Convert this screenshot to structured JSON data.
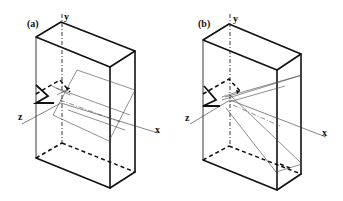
{
  "figure": {
    "panels": [
      {
        "id": "a",
        "label": "(a)",
        "axes": {
          "x": "x",
          "y": "y",
          "z": "z"
        }
      },
      {
        "id": "b",
        "label": "(b)",
        "axes": {
          "x": "x",
          "y": "y",
          "z": "z"
        }
      }
    ],
    "colors": {
      "line": "#111111",
      "background": "#ffffff"
    }
  }
}
